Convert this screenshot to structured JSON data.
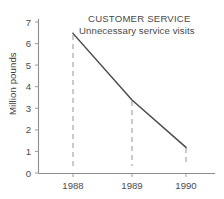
{
  "chart_data": {
    "type": "line",
    "title": "CUSTOMER SERVICE",
    "subtitle": "Unnecessary service visits",
    "xlabel": "",
    "ylabel": "Million pounds",
    "categories": [
      "1988",
      "1989",
      "1990"
    ],
    "x": [
      1988,
      1989,
      1990
    ],
    "series": [
      {
        "name": "Unnecessary service visits",
        "values": [
          6.5,
          4.0,
          2.15
        ]
      }
    ],
    "ylim": [
      0,
      7
    ],
    "yticks": [
      0,
      1,
      2,
      3,
      4,
      5,
      6,
      7
    ],
    "ytick_labels": [
      "0",
      "1",
      "2",
      "3",
      "4",
      "5",
      "6",
      "7"
    ],
    "xtick_labels": [
      "1988",
      "1989",
      "1990"
    ],
    "grid": false,
    "legend": false,
    "droplines": true,
    "colors": {
      "line": "#4c4c4c",
      "axis": "#8d8d8d",
      "dropline": "#b4b4b4",
      "text": "#4a4a4a",
      "background": "#ffffff"
    }
  },
  "ytick_positions": {
    "0": 173.0,
    "1": 151.4,
    "2": 129.9,
    "3": 108.3,
    "4": 86.7,
    "5": 65.1,
    "6": 43.6,
    "7": 22.0
  },
  "xtick_positions": {
    "1988": 73,
    "1989": 132,
    "1990": 186
  },
  "point_positions": [
    {
      "label": "1988",
      "x": 73,
      "y": 33.4,
      "value": 6.5
    },
    {
      "label": "1989",
      "x": 132,
      "y": 100.0,
      "value": 4.0
    },
    {
      "label": "1990",
      "x": 186,
      "y": 147.4,
      "value": 2.15
    }
  ],
  "dropline_extents": [
    {
      "label": "1988",
      "x": 73,
      "top": 35,
      "bottom": 166
    },
    {
      "label": "1989",
      "x": 132,
      "top": 101,
      "bottom": 166
    },
    {
      "label": "1990",
      "x": 186,
      "top": 148,
      "bottom": 166
    }
  ]
}
